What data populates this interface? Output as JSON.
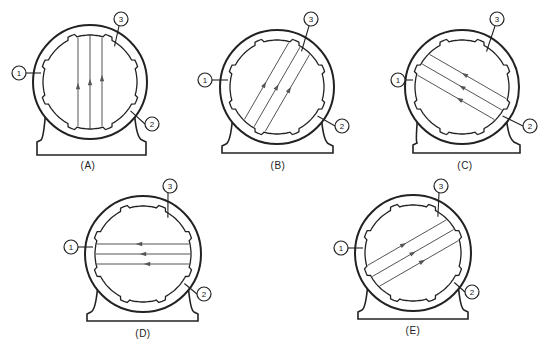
{
  "diagram": {
    "stroke_color": "#222222",
    "line_color": "#555555",
    "callout_labels": [
      "1",
      "2",
      "3"
    ],
    "panels": [
      {
        "id": "A",
        "caption": "(A)",
        "center": [
          90,
          82
        ],
        "outer_r": 57,
        "bore_r": 47,
        "rotor_angle_deg": 90,
        "arrow_dir": 1,
        "lines": 3,
        "strip_half_width": 12,
        "base": {
          "x1": 37,
          "x2": 146,
          "top": 140,
          "bottom": 155
        },
        "callouts": {
          "1": [
            19,
            73
          ],
          "2": [
            152,
            124
          ],
          "3": [
            121,
            19
          ]
        },
        "caption_pos": [
          88,
          168
        ]
      },
      {
        "id": "B",
        "caption": "(B)",
        "center": [
          277,
          87
        ],
        "outer_r": 57,
        "bore_r": 47,
        "rotor_angle_deg": 60,
        "arrow_dir": 1,
        "lines": 3,
        "strip_half_width": 12,
        "base": {
          "x1": 222,
          "x2": 333,
          "top": 144,
          "bottom": 153
        },
        "callouts": {
          "1": [
            205,
            80
          ],
          "2": [
            342,
            126
          ],
          "3": [
            311,
            19
          ]
        },
        "caption_pos": [
          278,
          168
        ]
      },
      {
        "id": "C",
        "caption": "(C)",
        "center": [
          462,
          87
        ],
        "outer_r": 57,
        "bore_r": 47,
        "rotor_angle_deg": 150,
        "arrow_dir": 1,
        "lines": 3,
        "strip_half_width": 12,
        "base": {
          "x1": 413,
          "x2": 520,
          "top": 143,
          "bottom": 153
        },
        "callouts": {
          "1": [
            398,
            80
          ],
          "2": [
            530,
            126
          ],
          "3": [
            497,
            19
          ]
        },
        "caption_pos": [
          465,
          168
        ]
      },
      {
        "id": "D",
        "caption": "(D)",
        "center": [
          143,
          254
        ],
        "outer_r": 58,
        "bore_r": 48,
        "rotor_angle_deg": 180,
        "arrow_dir": 1,
        "lines": 3,
        "strip_half_width": 10,
        "base": {
          "x1": 87,
          "x2": 198,
          "top": 312,
          "bottom": 321
        },
        "callouts": {
          "1": [
            71,
            247
          ],
          "2": [
            204,
            294
          ],
          "3": [
            170,
            186
          ]
        },
        "caption_pos": [
          143,
          336
        ]
      },
      {
        "id": "E",
        "caption": "(E)",
        "center": [
          413,
          253
        ],
        "outer_r": 58,
        "bore_r": 48,
        "rotor_angle_deg": 30,
        "arrow_dir": 1,
        "lines": 3,
        "strip_half_width": 12,
        "base": {
          "x1": 358,
          "x2": 468,
          "top": 310,
          "bottom": 319
        },
        "callouts": {
          "1": [
            341,
            248
          ],
          "2": [
            472,
            292
          ],
          "3": [
            441,
            186
          ]
        },
        "caption_pos": [
          413,
          333
        ]
      }
    ]
  }
}
